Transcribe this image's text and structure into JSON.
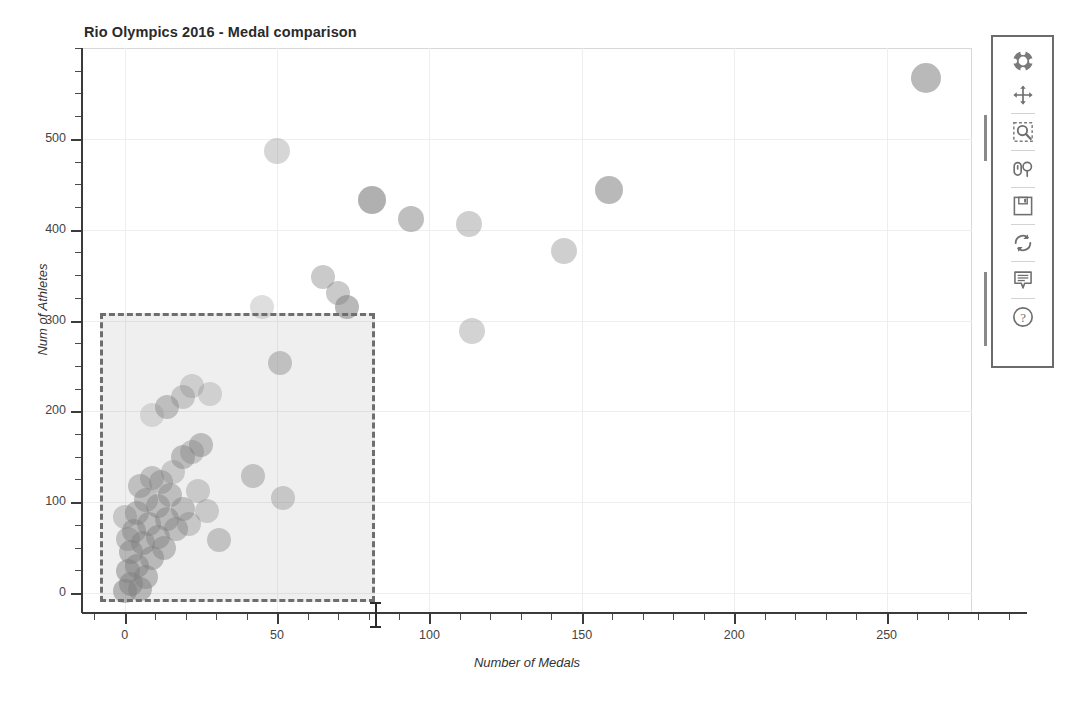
{
  "chart_data": {
    "type": "scatter",
    "title": "Rio Olympics 2016 - Medal comparison",
    "xlabel": "Number of Medals",
    "ylabel": "Num of Athletes",
    "xlim": [
      -14,
      278
    ],
    "ylim": [
      -22,
      600
    ],
    "grid": true,
    "legend": null,
    "x_ticks": [
      0,
      50,
      100,
      150,
      200,
      250
    ],
    "y_ticks": [
      0,
      100,
      200,
      300,
      400,
      500
    ],
    "x_tick_labels": [
      "0",
      "50",
      "100",
      "150",
      "200",
      "250"
    ],
    "y_tick_labels": [
      "0",
      "100",
      "200",
      "300",
      "400",
      "500"
    ],
    "marker": "circle",
    "marker_color": "#808080",
    "marker_alpha": 0.45,
    "points": [
      {
        "x": 263,
        "y": 567,
        "r": 15,
        "a": 0.55
      },
      {
        "x": 50,
        "y": 487,
        "r": 13,
        "a": 0.32
      },
      {
        "x": 81,
        "y": 433,
        "r": 14,
        "a": 0.62
      },
      {
        "x": 94,
        "y": 412,
        "r": 13,
        "a": 0.5
      },
      {
        "x": 159,
        "y": 444,
        "r": 14,
        "a": 0.55
      },
      {
        "x": 113,
        "y": 406,
        "r": 13,
        "a": 0.38
      },
      {
        "x": 144,
        "y": 377,
        "r": 13,
        "a": 0.38
      },
      {
        "x": 114,
        "y": 289,
        "r": 13,
        "a": 0.35
      },
      {
        "x": 65,
        "y": 348,
        "r": 12,
        "a": 0.42
      },
      {
        "x": 70,
        "y": 330,
        "r": 12,
        "a": 0.42
      },
      {
        "x": 73,
        "y": 315,
        "r": 12,
        "a": 0.55
      },
      {
        "x": 45,
        "y": 315,
        "r": 12,
        "a": 0.26
      },
      {
        "x": 51,
        "y": 253,
        "r": 12,
        "a": 0.42
      },
      {
        "x": 22,
        "y": 228,
        "r": 12,
        "a": 0.3
      },
      {
        "x": 28,
        "y": 219,
        "r": 12,
        "a": 0.28
      },
      {
        "x": 19,
        "y": 216,
        "r": 12,
        "a": 0.36
      },
      {
        "x": 14,
        "y": 205,
        "r": 12,
        "a": 0.44
      },
      {
        "x": 9,
        "y": 196,
        "r": 12,
        "a": 0.24
      },
      {
        "x": 25,
        "y": 163,
        "r": 12,
        "a": 0.46
      },
      {
        "x": 22,
        "y": 155,
        "r": 12,
        "a": 0.38
      },
      {
        "x": 19,
        "y": 150,
        "r": 12,
        "a": 0.46
      },
      {
        "x": 42,
        "y": 129,
        "r": 12,
        "a": 0.4
      },
      {
        "x": 52,
        "y": 105,
        "r": 12,
        "a": 0.36
      },
      {
        "x": 31,
        "y": 58,
        "r": 12,
        "a": 0.4
      },
      {
        "x": 9,
        "y": 127,
        "r": 12,
        "a": 0.4
      },
      {
        "x": 12,
        "y": 122,
        "r": 12,
        "a": 0.42
      },
      {
        "x": 5,
        "y": 118,
        "r": 12,
        "a": 0.42
      },
      {
        "x": 15,
        "y": 108,
        "r": 12,
        "a": 0.44
      },
      {
        "x": 7,
        "y": 102,
        "r": 12,
        "a": 0.44
      },
      {
        "x": 11,
        "y": 96,
        "r": 12,
        "a": 0.46
      },
      {
        "x": 19,
        "y": 93,
        "r": 12,
        "a": 0.44
      },
      {
        "x": 4,
        "y": 88,
        "r": 12,
        "a": 0.46
      },
      {
        "x": 14,
        "y": 82,
        "r": 12,
        "a": 0.48
      },
      {
        "x": 8,
        "y": 76,
        "r": 12,
        "a": 0.46
      },
      {
        "x": 17,
        "y": 70,
        "r": 12,
        "a": 0.44
      },
      {
        "x": 3,
        "y": 68,
        "r": 12,
        "a": 0.48
      },
      {
        "x": 11,
        "y": 62,
        "r": 12,
        "a": 0.48
      },
      {
        "x": 6,
        "y": 55,
        "r": 12,
        "a": 0.5
      },
      {
        "x": 13,
        "y": 50,
        "r": 12,
        "a": 0.46
      },
      {
        "x": 2,
        "y": 45,
        "r": 12,
        "a": 0.5
      },
      {
        "x": 9,
        "y": 38,
        "r": 12,
        "a": 0.48
      },
      {
        "x": 4,
        "y": 30,
        "r": 12,
        "a": 0.5
      },
      {
        "x": 1,
        "y": 24,
        "r": 12,
        "a": 0.5
      },
      {
        "x": 7,
        "y": 18,
        "r": 12,
        "a": 0.48
      },
      {
        "x": 2,
        "y": 10,
        "r": 12,
        "a": 0.52
      },
      {
        "x": 5,
        "y": 4,
        "r": 12,
        "a": 0.5
      },
      {
        "x": 0,
        "y": 2,
        "r": 12,
        "a": 0.52
      },
      {
        "x": 16,
        "y": 133,
        "r": 12,
        "a": 0.34
      },
      {
        "x": 24,
        "y": 112,
        "r": 12,
        "a": 0.34
      },
      {
        "x": 1,
        "y": 60,
        "r": 12,
        "a": 0.42
      },
      {
        "x": 0,
        "y": 84,
        "r": 12,
        "a": 0.36
      },
      {
        "x": 21,
        "y": 76,
        "r": 12,
        "a": 0.36
      },
      {
        "x": 27,
        "y": 90,
        "r": 12,
        "a": 0.34
      }
    ]
  },
  "selection": {
    "name": "box-select-region",
    "x_min": -8,
    "x_max": 82,
    "y_min": -10,
    "y_max": 308
  },
  "toolbar": {
    "name": "bokeh-toolbar",
    "tools": [
      {
        "id": "bokeh-logo",
        "label": "Bokeh",
        "icon": "bokeh-logo-icon"
      },
      {
        "id": "pan-tool",
        "label": "Pan",
        "icon": "pan-icon"
      },
      {
        "id": "box-zoom-tool",
        "label": "Box Zoom",
        "icon": "box-zoom-icon"
      },
      {
        "id": "wheel-zoom-tool",
        "label": "Wheel Zoom",
        "icon": "wheel-zoom-icon"
      },
      {
        "id": "save-tool",
        "label": "Save",
        "icon": "save-disk-icon"
      },
      {
        "id": "reset-tool",
        "label": "Reset",
        "icon": "reset-icon"
      },
      {
        "id": "hover-tool",
        "label": "Hover",
        "icon": "hover-tooltip-icon"
      },
      {
        "id": "help-tool",
        "label": "Help",
        "icon": "help-question-icon"
      }
    ]
  },
  "cursor": {
    "name": "text-ibeam-cursor",
    "x": 82,
    "axis": "x"
  }
}
